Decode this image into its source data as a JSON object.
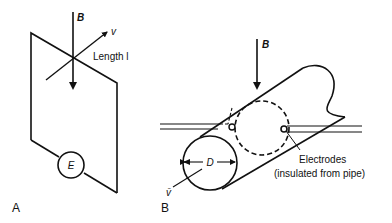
{
  "panel_a": {
    "label": "A",
    "field_label": "B",
    "velocity_label": "v",
    "length_label": "Length l",
    "emf_label": "E"
  },
  "panel_b": {
    "label": "B",
    "field_label": "B",
    "diameter_label": "D",
    "velocity_label": "v̄",
    "electrodes_label": "Electrodes",
    "electrodes_note": "(insulated from pipe)"
  },
  "colors": {
    "stroke": "#111111",
    "background": "#ffffff"
  }
}
